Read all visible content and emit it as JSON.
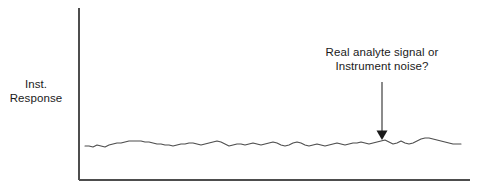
{
  "figure": {
    "background_color": "#ffffff",
    "axis_color": "#4d4d4d",
    "trace_color": "#4d4d4d",
    "text_color": "#1a1a1a"
  },
  "axis_label": {
    "line1": "Inst.",
    "line2": "Response"
  },
  "annotation": {
    "line1": "Real analyte signal or",
    "line2": "Instrument noise?"
  },
  "chart_data": {
    "type": "line",
    "title": "",
    "xlabel": "",
    "ylabel": "Inst. Response",
    "grid": false,
    "legend": null,
    "axes": {
      "y_axis_line": {
        "x": 79,
        "y_top": 8,
        "y_bottom": 180
      },
      "x_axis_line": {
        "y": 180,
        "x_left": 79,
        "x_right": 470
      },
      "ticks": [],
      "tick_labels": []
    },
    "annotations": [
      {
        "text": "Real analyte signal or Instrument noise?",
        "arrow": {
          "x": 382,
          "y_start": 82,
          "y_tip": 140,
          "direction": "down"
        }
      }
    ],
    "series": [
      {
        "name": "baseline noise trace",
        "x": [
          85,
          89,
          93,
          97,
          101,
          105,
          109,
          113,
          117,
          121,
          125,
          129,
          133,
          137,
          141,
          145,
          149,
          153,
          157,
          161,
          165,
          169,
          173,
          177,
          181,
          185,
          189,
          193,
          197,
          201,
          205,
          209,
          213,
          217,
          221,
          225,
          229,
          233,
          237,
          241,
          245,
          249,
          253,
          257,
          261,
          265,
          269,
          273,
          277,
          281,
          285,
          289,
          293,
          297,
          301,
          305,
          309,
          313,
          317,
          321,
          325,
          329,
          333,
          337,
          341,
          345,
          349,
          353,
          357,
          361,
          365,
          369,
          373,
          377,
          381,
          385,
          389,
          393,
          397,
          401,
          405,
          409,
          413,
          417,
          421,
          425,
          429,
          433,
          437,
          441,
          445,
          449,
          453,
          457,
          461
        ],
        "y": [
          146,
          146,
          147,
          145,
          146,
          147,
          145,
          144,
          143,
          143,
          142,
          141,
          141,
          141,
          141,
          142,
          142,
          143,
          144,
          144,
          145,
          145,
          146,
          145,
          144,
          144,
          143,
          143,
          144,
          145,
          144,
          143,
          142,
          141,
          142,
          144,
          146,
          145,
          144,
          144,
          145,
          144,
          143,
          144,
          145,
          144,
          143,
          142,
          143,
          145,
          146,
          145,
          143,
          142,
          143,
          145,
          146,
          145,
          144,
          145,
          146,
          145,
          144,
          143,
          144,
          145,
          144,
          143,
          143,
          142,
          143,
          144,
          143,
          142,
          141,
          140,
          142,
          144,
          143,
          141,
          143,
          144,
          143,
          141,
          139,
          138,
          138,
          139,
          140,
          141,
          142,
          143,
          144,
          144,
          144
        ]
      }
    ]
  }
}
